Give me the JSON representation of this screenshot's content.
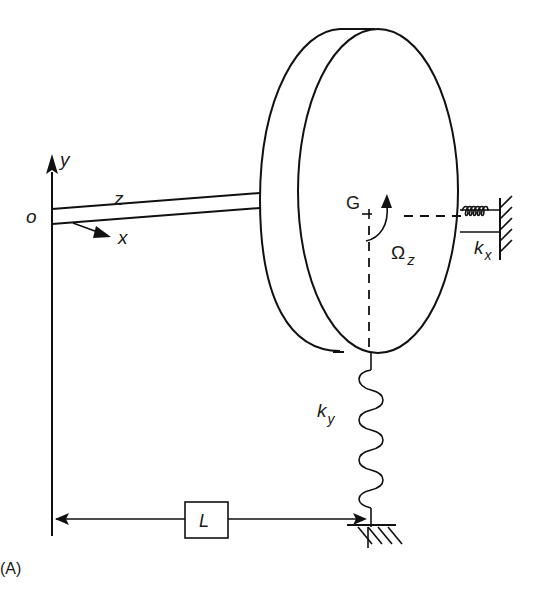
{
  "figure": {
    "panel_label": "(A)"
  },
  "axes": {
    "origin": "o",
    "x": "x",
    "y": "y",
    "z": "z"
  },
  "disc": {
    "center_label": "G",
    "rotation_symbol": "Ω",
    "rotation_subscript": "z"
  },
  "springs": {
    "horizontal": {
      "symbol": "k",
      "subscript": "x"
    },
    "vertical": {
      "symbol": "k",
      "subscript": "y"
    }
  },
  "dimension": {
    "label": "L"
  },
  "colors": {
    "line": "#111111",
    "background": "#ffffff"
  }
}
